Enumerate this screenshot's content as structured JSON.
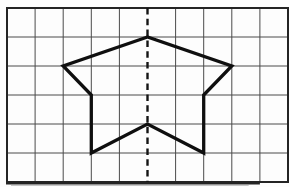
{
  "figure": {
    "canvas": {
      "width": 290,
      "height": 187,
      "background": "#fdfdfd"
    },
    "grid": {
      "x": 7,
      "y": 8,
      "cols": 10,
      "rows": 6,
      "cell_width": 28.1,
      "cell_height": 29,
      "line_color": "#4a4a4a",
      "line_width": 1,
      "border_color": "#242424",
      "border_width": 2,
      "bottom_edge_width": 3.5
    },
    "symmetry_axis": {
      "grid_column": 5,
      "style": "dashed",
      "color": "#141414",
      "width": 2.4,
      "dash": "6.5 4.3"
    },
    "star": {
      "color": "#0f0f0f",
      "stroke_width": 3.3,
      "vertices_grid_units": [
        [
          5,
          1
        ],
        [
          2,
          2
        ],
        [
          3,
          3
        ],
        [
          3,
          5
        ],
        [
          5,
          4
        ],
        [
          7,
          5
        ],
        [
          7,
          3
        ],
        [
          8,
          2
        ]
      ]
    },
    "scan_shadow": {
      "color": "#9a9a9a",
      "opacity": 0.55
    }
  }
}
